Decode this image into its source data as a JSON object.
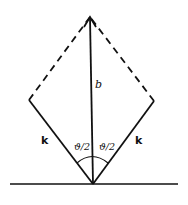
{
  "diagram": {
    "type": "vector-diagram",
    "labels": {
      "vertical_vector": "b",
      "left_vector": "k",
      "right_vector": "k",
      "left_angle": "ϑ/2",
      "right_angle": "ϑ/2"
    },
    "geometry": {
      "origin": [
        93,
        184
      ],
      "top": [
        90,
        17
      ],
      "left_corner": [
        29,
        100
      ],
      "right_corner": [
        154,
        101
      ],
      "baseline": {
        "x1": 10,
        "x2": 178,
        "y": 184
      }
    },
    "colors": {
      "stroke": "#111111",
      "background": "#ffffff"
    }
  }
}
